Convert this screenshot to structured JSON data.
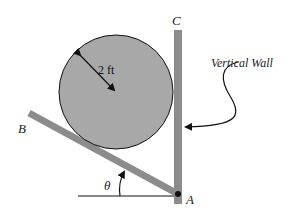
{
  "diagram": {
    "labels": {
      "point_c": "C",
      "point_b": "B",
      "point_a": "A",
      "angle": "θ",
      "radius": "2 ft",
      "wall": "Vertical Wall"
    },
    "colors": {
      "fill": "#a8a8a8",
      "bar": "#8c8c8c",
      "stroke": "#111111"
    }
  }
}
